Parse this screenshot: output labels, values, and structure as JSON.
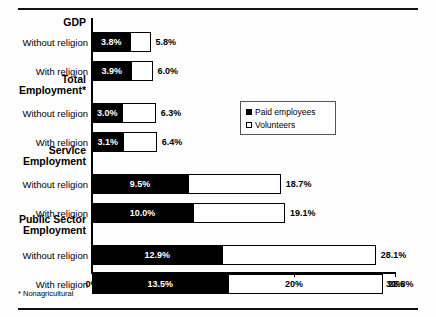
{
  "chart_data": {
    "type": "bar",
    "orientation": "horizontal",
    "stacked": true,
    "title": "",
    "xlabel": "",
    "ylabel": "",
    "xlim": [
      0,
      30
    ],
    "xticks": [
      "0%",
      "10%",
      "20%",
      "30%"
    ],
    "xtick_values": [
      0,
      10,
      20,
      30
    ],
    "grid": false,
    "legend_position": "center-right",
    "series": [
      {
        "name": "Paid employees",
        "key": "paid",
        "color": "#000000"
      },
      {
        "name": "Volunteers",
        "key": "volunteers",
        "color": "#ffffff"
      }
    ],
    "groups": [
      {
        "label": "GDP",
        "rows": [
          {
            "category": "Without religion",
            "paid": 3.8,
            "volunteers": 2.0,
            "total": 5.8,
            "paid_label": "3.8%",
            "total_label": "5.8%"
          },
          {
            "category": "With religion",
            "paid": 3.9,
            "volunteers": 2.1,
            "total": 6.0,
            "paid_label": "3.9%",
            "total_label": "6.0%"
          }
        ]
      },
      {
        "label": "Total Employment*",
        "rows": [
          {
            "category": "Without religion",
            "paid": 3.0,
            "volunteers": 3.3,
            "total": 6.3,
            "paid_label": "3.0%",
            "total_label": "6.3%"
          },
          {
            "category": "With religion",
            "paid": 3.1,
            "volunteers": 3.3,
            "total": 6.4,
            "paid_label": "3.1%",
            "total_label": "6.4%"
          }
        ]
      },
      {
        "label": "Service Employment",
        "rows": [
          {
            "category": "Without religion",
            "paid": 9.5,
            "volunteers": 9.2,
            "total": 18.7,
            "paid_label": "9.5%",
            "total_label": "18.7%"
          },
          {
            "category": "With religion",
            "paid": 10.0,
            "volunteers": 9.1,
            "total": 19.1,
            "paid_label": "10.0%",
            "total_label": "19.1%"
          }
        ]
      },
      {
        "label": "Public Sector Employment",
        "rows": [
          {
            "category": "Without religion",
            "paid": 12.9,
            "volunteers": 15.2,
            "total": 28.1,
            "paid_label": "12.9%",
            "total_label": "28.1%"
          },
          {
            "category": "With religion",
            "paid": 13.5,
            "volunteers": 15.3,
            "total": 28.8,
            "paid_label": "13.5%",
            "total_label": "28.8%"
          }
        ]
      }
    ]
  },
  "legend": {
    "items": [
      {
        "label": "Paid employees",
        "swatch": "filled-square-icon"
      },
      {
        "label": "Volunteers",
        "swatch": "hollow-square-icon"
      }
    ]
  },
  "footnote": "* Nonagricultural",
  "axis": {
    "ticks": [
      {
        "label": "0%",
        "value": 0
      },
      {
        "label": "10%",
        "value": 10
      },
      {
        "label": "20%",
        "value": 20
      },
      {
        "label": "30%",
        "value": 30
      }
    ]
  },
  "group_labels": {
    "gdp": "GDP",
    "total_employment_line1": "Total",
    "total_employment_line2": "Employment*",
    "service_line1": "Service",
    "service_line2": "Employment",
    "public_line1": "Public Sector",
    "public_line2": "Employment"
  }
}
